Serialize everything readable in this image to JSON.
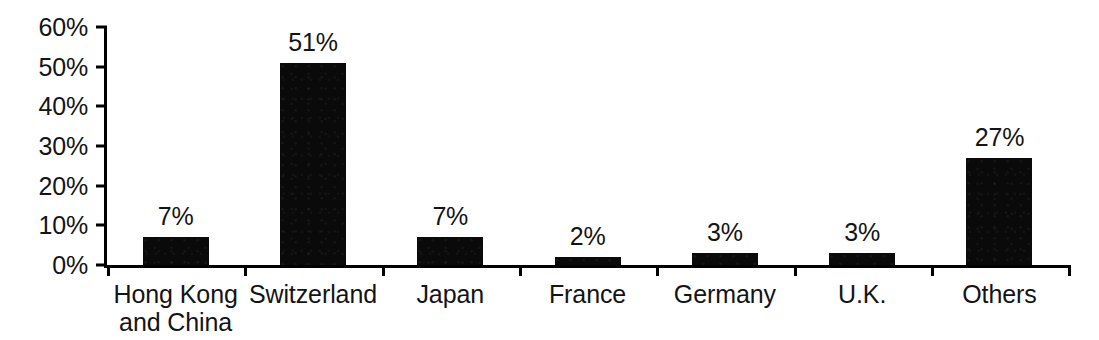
{
  "chart_data": {
    "type": "bar",
    "title": "",
    "subtitle": "",
    "xlabel": "",
    "ylabel": "",
    "categories": [
      "Hong Kong\nand China",
      "Switzerland",
      "Japan",
      "France",
      "Germany",
      "U.K.",
      "Others"
    ],
    "values": [
      7,
      51,
      7,
      2,
      3,
      3,
      27
    ],
    "value_labels": [
      "7%",
      "51%",
      "7%",
      "2%",
      "3%",
      "3%",
      "27%"
    ],
    "ylim": [
      0,
      60
    ],
    "ytick_values": [
      0,
      10,
      20,
      30,
      40,
      50,
      60
    ],
    "ytick_labels": [
      "0%",
      "10%",
      "20%",
      "30%",
      "40%",
      "50%",
      "60%"
    ],
    "grid": false,
    "legend": "none",
    "bar_color": "#0a0a0a",
    "axis_color": "#000000",
    "text_color": "#141414",
    "background_color": "#ffffff"
  }
}
